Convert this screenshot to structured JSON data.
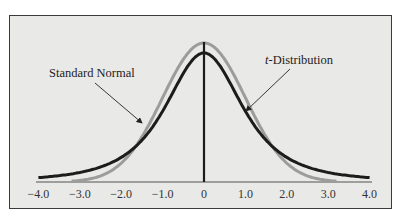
{
  "chart_data": {
    "type": "line",
    "title": "",
    "xlabel": "",
    "ylabel": "",
    "xlim": [
      -4.0,
      4.0
    ],
    "grid": false,
    "legend": "annotations with arrows",
    "tick_labels": [
      "−4.0",
      "−3.0",
      "−2.0",
      "−1.0",
      "0",
      "1.0",
      "2.0",
      "3.0",
      "4.0"
    ],
    "ticks": [
      -4,
      -3,
      -2,
      -1,
      0,
      1,
      2,
      3,
      4
    ],
    "series": [
      {
        "name": "Standard Normal",
        "color": "#9a9a9a",
        "x_range": [
          -3.2,
          3.2
        ],
        "description": "taller, narrower bell curve with thin tails",
        "peak_relative": 1.0
      },
      {
        "name": "t-Distribution",
        "color": "#1e1e1e",
        "x_range": [
          -4.0,
          4.0
        ],
        "description": "shorter bell curve with heavier tails",
        "peak_relative": 0.92
      }
    ],
    "annotations": [
      {
        "text": "Standard Normal",
        "points_to": "Standard Normal"
      },
      {
        "text_italic": "t",
        "text": "-Distribution",
        "points_to": "t-Distribution"
      }
    ]
  },
  "labels": {
    "standard_normal": "Standard Normal",
    "t_italic": "t",
    "t_rest": "-Distribution"
  }
}
